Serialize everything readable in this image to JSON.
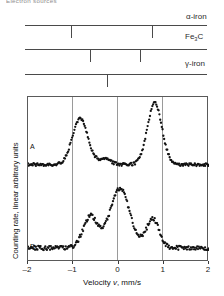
{
  "figure": {
    "top_caption": "Electron sources",
    "width": 224,
    "height": 296
  },
  "stick_diagram": {
    "rows": [
      {
        "label": "α-iron",
        "label_id": "alpha-iron",
        "line_y": 25,
        "x_start": 25,
        "x_end": 207,
        "ticks": [
          71,
          152
        ],
        "tick_dir": "down",
        "tick_len": 13,
        "label_x": 186,
        "label_y": 13
      },
      {
        "label": "Fe₃C",
        "label_id": "fe3c-cementite",
        "line_y": 49,
        "x_start": 25,
        "x_end": 207,
        "ticks": [
          90,
          140
        ],
        "tick_dir": "down",
        "tick_len": 13,
        "label_x": 185,
        "label_y": 33
      },
      {
        "label": "γ-iron",
        "label_id": "gamma-iron",
        "line_y": 74,
        "x_start": 25,
        "x_end": 207,
        "ticks": [
          107
        ],
        "tick_dir": "down",
        "tick_len": 13,
        "label_x": 185,
        "label_y": 60
      }
    ]
  },
  "plot": {
    "frame": {
      "left": 27,
      "top": 96,
      "width": 181,
      "height": 165
    },
    "gridlines_at_velocity": [
      -1,
      0,
      1
    ],
    "y_axis_label": "Counting rate, linear arbitrary units",
    "x_axis_title_prefix": "Velocity ",
    "x_axis_title_symbol": "v",
    "x_axis_title_suffix": ", mm/s",
    "x_ticks": [
      {
        "value": -2,
        "label": "–2"
      },
      {
        "value": -1,
        "label": "–1"
      },
      {
        "value": 0,
        "label": "0"
      },
      {
        "value": 1,
        "label": "1"
      },
      {
        "value": 2,
        "label": "2"
      }
    ],
    "trace_color": "#121212",
    "spectra": [
      {
        "id": "A",
        "label": "A",
        "label_x": 30,
        "label_y": 147
      },
      {
        "id": "B",
        "label": "B",
        "label_x": 30,
        "label_y": 246
      }
    ]
  },
  "chart_data": {
    "type": "line",
    "title": "",
    "xlabel": "Velocity v, mm/s",
    "ylabel": "Counting rate, linear arbitrary units",
    "xlim": [
      -2,
      2
    ],
    "grid": true,
    "gridlines_x": [
      -1,
      0,
      1
    ],
    "legend": "none",
    "annotations": [
      "A",
      "B",
      "α-iron",
      "Fe₃C",
      "γ-iron"
    ],
    "reference_lines": {
      "alpha-iron": [
        -1.02,
        0.77
      ],
      "Fe3C": [
        -0.58,
        0.52
      ],
      "gamma-iron": [
        -0.23
      ]
    },
    "series": [
      {
        "name": "A",
        "baseline": 0.12,
        "peaks": [
          {
            "center": -0.85,
            "height": 0.78,
            "width": 0.17
          },
          {
            "center": -0.3,
            "height": 0.2,
            "width": 0.13
          },
          {
            "center": 0.8,
            "height": 1.0,
            "width": 0.16
          }
        ],
        "x": [
          -2.0,
          -1.9,
          -1.8,
          -1.7,
          -1.6,
          -1.5,
          -1.4,
          -1.3,
          -1.2,
          -1.1,
          -1.0,
          -0.9,
          -0.85,
          -0.8,
          -0.7,
          -0.6,
          -0.5,
          -0.4,
          -0.3,
          -0.2,
          -0.1,
          0.0,
          0.1,
          0.2,
          0.3,
          0.4,
          0.5,
          0.6,
          0.7,
          0.8,
          0.9,
          1.0,
          1.1,
          1.2,
          1.3,
          1.4,
          1.5,
          1.6,
          1.7,
          1.8,
          1.9,
          2.0
        ],
        "y": [
          0.34,
          0.22,
          0.16,
          0.13,
          0.12,
          0.12,
          0.13,
          0.16,
          0.23,
          0.45,
          0.68,
          0.77,
          0.78,
          0.72,
          0.48,
          0.29,
          0.22,
          0.24,
          0.26,
          0.22,
          0.16,
          0.14,
          0.13,
          0.14,
          0.16,
          0.2,
          0.29,
          0.47,
          0.76,
          1.0,
          0.82,
          0.48,
          0.26,
          0.17,
          0.14,
          0.13,
          0.13,
          0.14,
          0.16,
          0.2,
          0.27,
          0.34
        ]
      },
      {
        "name": "B",
        "baseline": 0.1,
        "peaks": [
          {
            "center": -0.62,
            "height": 0.55,
            "width": 0.16
          },
          {
            "center": 0.03,
            "height": 0.95,
            "width": 0.22
          },
          {
            "center": 0.76,
            "height": 0.52,
            "width": 0.14
          }
        ],
        "x": [
          -2.0,
          -1.9,
          -1.8,
          -1.7,
          -1.6,
          -1.5,
          -1.4,
          -1.3,
          -1.2,
          -1.1,
          -1.0,
          -0.9,
          -0.8,
          -0.7,
          -0.62,
          -0.55,
          -0.45,
          -0.35,
          -0.25,
          -0.15,
          -0.05,
          0.03,
          0.1,
          0.2,
          0.3,
          0.4,
          0.5,
          0.6,
          0.7,
          0.76,
          0.85,
          0.95,
          1.05,
          1.15,
          1.25,
          1.4,
          1.55,
          1.7,
          1.85,
          2.0
        ],
        "y": [
          0.13,
          0.15,
          0.12,
          0.14,
          0.11,
          0.13,
          0.11,
          0.12,
          0.14,
          0.17,
          0.23,
          0.33,
          0.46,
          0.53,
          0.55,
          0.48,
          0.34,
          0.28,
          0.38,
          0.62,
          0.86,
          0.95,
          0.88,
          0.68,
          0.5,
          0.38,
          0.29,
          0.26,
          0.4,
          0.52,
          0.4,
          0.26,
          0.18,
          0.13,
          0.11,
          0.1,
          0.1,
          0.11,
          0.13,
          0.17
        ]
      }
    ]
  }
}
